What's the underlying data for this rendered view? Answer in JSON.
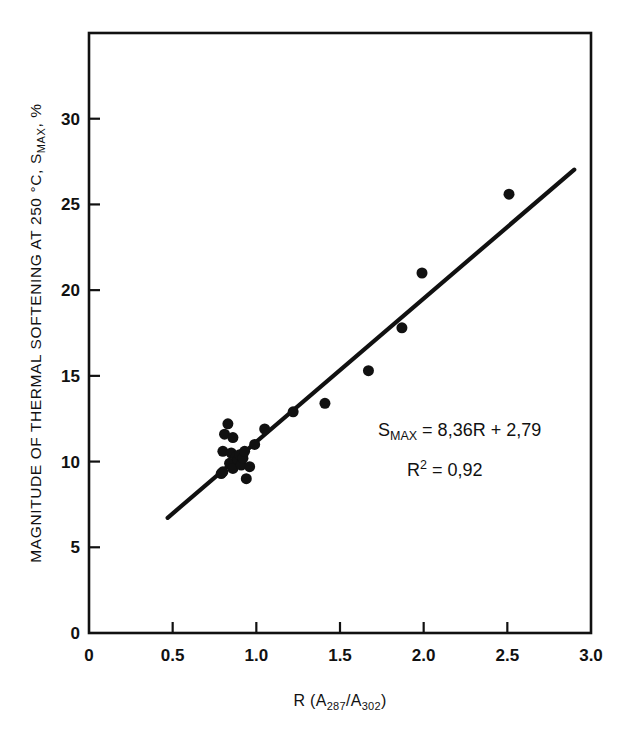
{
  "figure": {
    "background_color": "#ffffff",
    "ink_color": "#111111"
  },
  "chart_data": {
    "type": "scatter",
    "title": "",
    "subtitle": "",
    "xlabel": "R (A287/A302)",
    "xlabel_parts": {
      "lead": "R (A",
      "sub1": "287",
      "mid": "/A",
      "sub2": "302",
      "tail": ")"
    },
    "ylabel": "MAGNITUDE OF THERMAL SOFTENING AT 250 °C, SMAX, %",
    "ylabel_parts": {
      "lead": "MAGNITUDE OF THERMAL SOFTENING AT 250 °C, S",
      "sub1": "MAX",
      "tail": ", %"
    },
    "xlim": [
      0,
      3.0
    ],
    "ylim": [
      0,
      35
    ],
    "xticks": [
      0,
      0.5,
      1.0,
      1.5,
      2.0,
      2.5,
      3.0
    ],
    "xtick_labels": [
      "0",
      "0.5",
      "1.0",
      "1.5",
      "2.0",
      "2.5",
      "3.0"
    ],
    "yticks": [
      0,
      5,
      10,
      15,
      20,
      25,
      30
    ],
    "ytick_labels": [
      "0",
      "5",
      "10",
      "15",
      "20",
      "25",
      "30"
    ],
    "grid": false,
    "legend": false,
    "legend_position": "none",
    "marker": "filled-circle",
    "marker_color": "#111111",
    "marker_size_px": 11,
    "points": [
      {
        "x": 0.79,
        "y": 9.3
      },
      {
        "x": 0.8,
        "y": 9.4
      },
      {
        "x": 0.8,
        "y": 10.6
      },
      {
        "x": 0.81,
        "y": 11.6
      },
      {
        "x": 0.83,
        "y": 12.2
      },
      {
        "x": 0.84,
        "y": 9.9
      },
      {
        "x": 0.85,
        "y": 10.5
      },
      {
        "x": 0.86,
        "y": 11.4
      },
      {
        "x": 0.86,
        "y": 9.6
      },
      {
        "x": 0.88,
        "y": 10.3
      },
      {
        "x": 0.89,
        "y": 10.1
      },
      {
        "x": 0.9,
        "y": 10.4
      },
      {
        "x": 0.91,
        "y": 9.8
      },
      {
        "x": 0.92,
        "y": 10.2
      },
      {
        "x": 0.93,
        "y": 10.6
      },
      {
        "x": 0.94,
        "y": 9.0
      },
      {
        "x": 0.96,
        "y": 9.7
      },
      {
        "x": 0.99,
        "y": 11.0
      },
      {
        "x": 1.05,
        "y": 11.9
      },
      {
        "x": 1.22,
        "y": 12.9
      },
      {
        "x": 1.41,
        "y": 13.4
      },
      {
        "x": 1.67,
        "y": 15.3
      },
      {
        "x": 1.87,
        "y": 17.8
      },
      {
        "x": 1.99,
        "y": 21.0
      },
      {
        "x": 2.51,
        "y": 25.6
      }
    ],
    "fit_line": {
      "type": "linear-regression",
      "slope": 8.36,
      "intercept": 2.79,
      "r_squared": 0.92,
      "x_start": 0.47,
      "x_end": 2.9,
      "y_start": 6.72,
      "y_end": 27.03,
      "color": "#111111",
      "width_px": 4.2
    },
    "annotations": [
      {
        "id": "equation",
        "text": "SMAX = 8,36R + 2,79",
        "parts": {
          "lead": "S",
          "sub": "MAX",
          "tail": " = 8,36R + 2,79"
        },
        "x": 1.45,
        "y": 11.4
      },
      {
        "id": "r-squared",
        "text": "R2 = 0,92",
        "parts": {
          "lead": "R",
          "sup": "2",
          "tail": " = 0,92"
        },
        "x": 1.62,
        "y": 9.1
      }
    ]
  }
}
